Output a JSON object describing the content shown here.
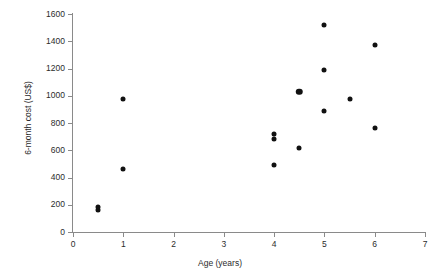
{
  "chart_data": {
    "type": "scatter",
    "title": "",
    "xlabel": "Age (years)",
    "ylabel": "6-month cost (US$)",
    "xlim": [
      0,
      7
    ],
    "ylim": [
      0,
      1600
    ],
    "xticks": [
      "0",
      "1",
      "2",
      "3",
      "4",
      "5",
      "6",
      "7"
    ],
    "xtick_values": [
      0,
      1,
      2,
      3,
      4,
      5,
      6,
      7
    ],
    "yticks": [
      "0",
      "200",
      "400",
      "600",
      "800",
      "1000",
      "1200",
      "1400",
      "1600"
    ],
    "ytick_values": [
      0,
      200,
      400,
      600,
      800,
      1000,
      1200,
      1400,
      1600
    ],
    "grid": false,
    "legend": null,
    "marker_color": "#111111",
    "axis_color": "#8a8a8a",
    "background_color": "#ffffff",
    "points": [
      {
        "x": 0.5,
        "y": 158,
        "emphasis": false
      },
      {
        "x": 0.5,
        "y": 182,
        "emphasis": false
      },
      {
        "x": 1.0,
        "y": 465,
        "emphasis": false
      },
      {
        "x": 1.0,
        "y": 975,
        "emphasis": false
      },
      {
        "x": 4.0,
        "y": 490,
        "emphasis": false
      },
      {
        "x": 4.0,
        "y": 680,
        "emphasis": false
      },
      {
        "x": 4.0,
        "y": 718,
        "emphasis": false
      },
      {
        "x": 4.5,
        "y": 618,
        "emphasis": false
      },
      {
        "x": 4.5,
        "y": 1030,
        "emphasis": true
      },
      {
        "x": 5.0,
        "y": 885,
        "emphasis": false
      },
      {
        "x": 5.0,
        "y": 1190,
        "emphasis": false
      },
      {
        "x": 5.0,
        "y": 1520,
        "emphasis": false
      },
      {
        "x": 5.5,
        "y": 978,
        "emphasis": false
      },
      {
        "x": 6.0,
        "y": 765,
        "emphasis": false
      },
      {
        "x": 6.0,
        "y": 1370,
        "emphasis": false
      }
    ]
  }
}
